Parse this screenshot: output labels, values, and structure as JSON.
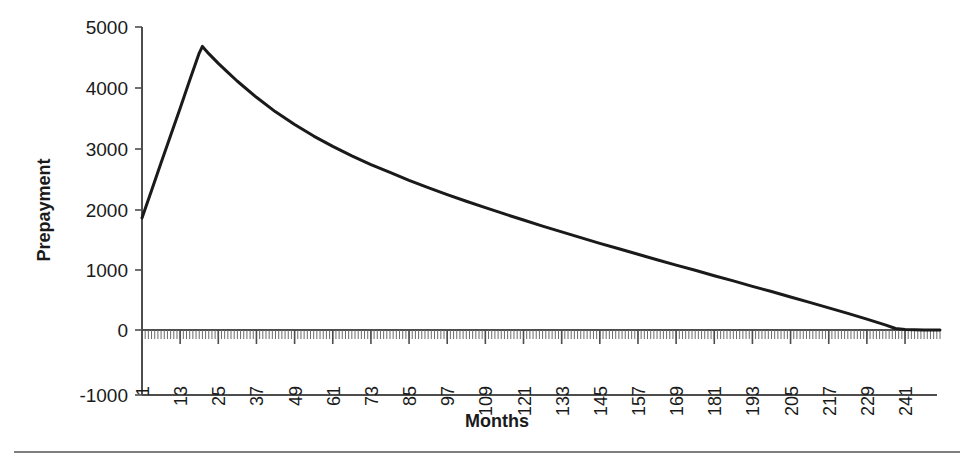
{
  "chart_data": {
    "type": "line",
    "title": "",
    "xlabel": "Months",
    "ylabel": "Prepayment",
    "xlim": [
      1,
      252
    ],
    "ylim": [
      -1000,
      5000
    ],
    "grid": false,
    "legend": "none",
    "y_ticks": [
      "5000",
      "4000",
      "3000",
      "2000",
      "1000",
      "0",
      "-1000"
    ],
    "y_tick_values": [
      5000,
      4000,
      3000,
      2000,
      1000,
      0,
      -1000
    ],
    "x_ticks": [
      "1",
      "13",
      "25",
      "37",
      "49",
      "61",
      "73",
      "85",
      "97",
      "109",
      "121",
      "133",
      "145",
      "157",
      "169",
      "181",
      "193",
      "205",
      "217",
      "229",
      "241"
    ],
    "x_tick_values": [
      1,
      13,
      25,
      37,
      49,
      61,
      73,
      85,
      97,
      109,
      121,
      133,
      145,
      157,
      169,
      181,
      193,
      205,
      217,
      229,
      241
    ],
    "minor_tick_interval": 1,
    "series": [
      {
        "name": "Prepayment",
        "color": "#1a1a1a",
        "x": [
          1,
          4,
          7,
          10,
          13,
          16,
          19,
          20,
          22,
          25,
          28,
          31,
          37,
          43,
          49,
          55,
          61,
          67,
          73,
          79,
          85,
          91,
          97,
          103,
          109,
          115,
          121,
          127,
          133,
          139,
          145,
          151,
          157,
          163,
          169,
          175,
          181,
          187,
          193,
          199,
          205,
          211,
          217,
          223,
          229,
          235,
          238,
          241,
          244,
          247,
          252
        ],
        "values": [
          1850,
          2300,
          2760,
          3210,
          3660,
          4120,
          4570,
          4680,
          4560,
          4400,
          4250,
          4105,
          3840,
          3600,
          3390,
          3200,
          3030,
          2875,
          2730,
          2600,
          2470,
          2350,
          2235,
          2125,
          2020,
          1915,
          1815,
          1715,
          1620,
          1525,
          1430,
          1340,
          1250,
          1160,
          1070,
          985,
          895,
          810,
          720,
          635,
          545,
          455,
          365,
          275,
          180,
          80,
          25,
          8,
          3,
          1,
          0
        ]
      }
    ]
  },
  "axes": {
    "y_title": "Prepayment",
    "x_title": "Months"
  }
}
